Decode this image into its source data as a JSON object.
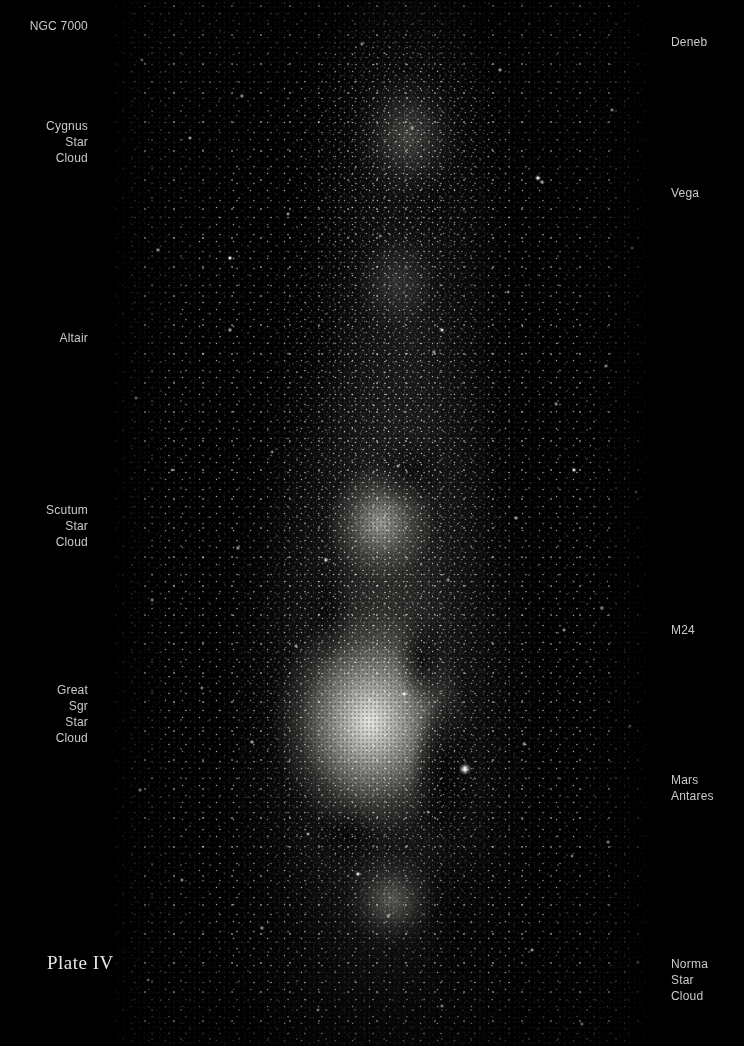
{
  "plate": {
    "caption": "Plate IV",
    "caption_x": 47,
    "caption_y": 952,
    "background_color": "#000000",
    "label_color": "#c9c9c9",
    "caption_color": "#e6e6e6"
  },
  "photo": {
    "name": "milky-way-photographic-plate",
    "left": 112,
    "top": 0,
    "width": 537,
    "height": 1046,
    "description": "Wide-field black and white photographic plate of the summer Milky Way from Cygnus through Sagittarius to Norma, showing star clouds and dark dust lanes."
  },
  "labels_left": [
    {
      "id": "ngc-7000",
      "text": "NGC 7000",
      "right": 88,
      "top": 18
    },
    {
      "id": "cygnus-star-cloud",
      "text": "Cygnus\nStar\nCloud",
      "right": 88,
      "top": 118
    },
    {
      "id": "altair",
      "text": "Altair",
      "right": 88,
      "top": 330
    },
    {
      "id": "scutum-star-cloud",
      "text": "Scutum\nStar\nCloud",
      "right": 88,
      "top": 502
    },
    {
      "id": "great-sgr-star-cloud",
      "text": "Great\nSgr\nStar\nCloud",
      "right": 88,
      "top": 682
    }
  ],
  "labels_right": [
    {
      "id": "deneb",
      "text": "Deneb",
      "left": 671,
      "top": 34
    },
    {
      "id": "vega",
      "text": "Vega",
      "left": 671,
      "top": 185
    },
    {
      "id": "m24",
      "text": "M24",
      "left": 671,
      "top": 622
    },
    {
      "id": "mars",
      "text": "Mars",
      "left": 671,
      "top": 772
    },
    {
      "id": "antares",
      "text": "Antares",
      "left": 671,
      "top": 788
    },
    {
      "id": "norma-star-cloud",
      "text": "Norma\nStar\nCloud",
      "left": 671,
      "top": 956
    }
  ],
  "bright_objects": [
    {
      "name": "mars-bright-star",
      "x": 465,
      "y": 769,
      "radius": 6.5
    },
    {
      "name": "field-star-bright-1",
      "x": 538,
      "y": 178,
      "radius": 3.4
    },
    {
      "name": "field-star-bright-2",
      "x": 404,
      "y": 694,
      "radius": 3.2
    }
  ]
}
